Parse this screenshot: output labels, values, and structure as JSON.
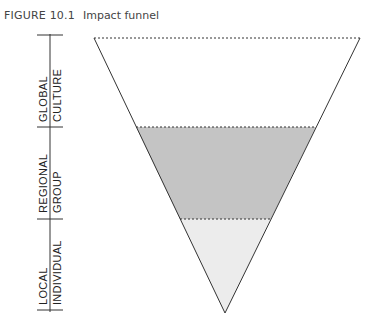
{
  "figure": {
    "number": "FIGURE 10.1",
    "title": "Impact funnel"
  },
  "axis": {
    "segments": [
      {
        "line1": "GLOBAL",
        "line2": "CULTURE"
      },
      {
        "line1": "REGIONAL",
        "line2": "GROUP"
      },
      {
        "line1": "LOCAL",
        "line2": "INDIVIDUAL"
      }
    ]
  },
  "funnel": {
    "levels": [
      {
        "name": "Global / Culture",
        "fill": "#ffffff"
      },
      {
        "name": "Regional / Group",
        "fill": "#c4c4c4"
      },
      {
        "name": "Local / Individual",
        "fill": "#ececec"
      }
    ],
    "outline_color": "#333333"
  }
}
